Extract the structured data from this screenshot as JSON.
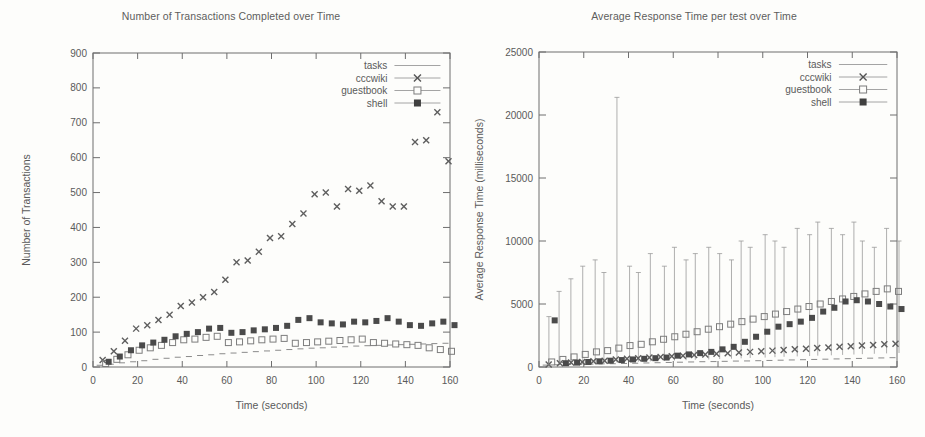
{
  "page": {
    "background": "#fdfdfb",
    "ink": "#5a5a5a"
  },
  "charts": [
    {
      "id": "transactions",
      "title": "Number of Transactions Completed over Time",
      "xlabel": "Time (seconds)",
      "ylabel": "Number of Transactions"
    },
    {
      "id": "response-time",
      "title": "Average Response Time per test over Time",
      "xlabel": "Time (seconds)",
      "ylabel": "Average Response Time (milliseconds)"
    }
  ],
  "chart_data": [
    {
      "type": "scatter",
      "id": "transactions",
      "title": "Number of Transactions Completed over Time",
      "xlabel": "Time (seconds)",
      "ylabel": "Number of Transactions",
      "xlim": [
        0,
        160
      ],
      "ylim": [
        0,
        900
      ],
      "xticks": [
        0,
        20,
        40,
        60,
        80,
        100,
        120,
        140,
        160
      ],
      "yticks": [
        0,
        100,
        200,
        300,
        400,
        500,
        600,
        700,
        800,
        900
      ],
      "grid": false,
      "legend_position": "top-right",
      "legend": [
        "tasks",
        "cccwiki",
        "guestbook",
        "shell"
      ],
      "x": [
        5,
        10,
        15,
        20,
        25,
        30,
        35,
        40,
        45,
        50,
        55,
        60,
        65,
        70,
        75,
        80,
        85,
        90,
        95,
        100,
        105,
        110,
        115,
        120,
        125,
        130,
        135,
        140,
        145,
        150,
        155,
        160
      ],
      "series": [
        {
          "name": "tasks",
          "marker": "line",
          "values": [
            5,
            8,
            12,
            15,
            18,
            22,
            25,
            28,
            30,
            33,
            35,
            38,
            40,
            42,
            44,
            46,
            48,
            50,
            52,
            54,
            55,
            57,
            58,
            60,
            61,
            62,
            63,
            64,
            65,
            66,
            67,
            68
          ]
        },
        {
          "name": "cccwiki",
          "marker": "cross",
          "values": [
            20,
            45,
            75,
            110,
            120,
            135,
            150,
            175,
            185,
            200,
            215,
            250,
            300,
            305,
            330,
            370,
            375,
            410,
            440,
            495,
            500,
            460,
            510,
            505,
            520,
            475,
            460,
            460,
            645,
            650,
            730,
            590
          ]
        },
        {
          "name": "guestbook",
          "marker": "open-square",
          "values": [
            10,
            22,
            35,
            48,
            55,
            62,
            70,
            78,
            80,
            85,
            88,
            70,
            72,
            75,
            78,
            80,
            82,
            68,
            70,
            72,
            74,
            76,
            78,
            80,
            70,
            68,
            66,
            64,
            62,
            55,
            50,
            45
          ]
        },
        {
          "name": "shell",
          "marker": "filled-square",
          "values": [
            15,
            30,
            48,
            62,
            70,
            78,
            88,
            95,
            100,
            110,
            112,
            98,
            100,
            105,
            108,
            112,
            118,
            135,
            140,
            128,
            125,
            122,
            130,
            128,
            132,
            140,
            130,
            120,
            118,
            125,
            130,
            120
          ]
        }
      ]
    },
    {
      "type": "scatter",
      "id": "response-time",
      "title": "Average Response Time per test over Time",
      "xlabel": "Time (seconds)",
      "ylabel": "Average Response Time (milliseconds)",
      "xlim": [
        0,
        160
      ],
      "ylim": [
        0,
        25000
      ],
      "xticks": [
        0,
        20,
        40,
        60,
        80,
        100,
        120,
        140,
        160
      ],
      "yticks": [
        0,
        5000,
        10000,
        15000,
        20000,
        25000
      ],
      "grid": false,
      "legend_position": "top-right",
      "legend": [
        "tasks",
        "cccwiki",
        "guestbook",
        "shell"
      ],
      "x": [
        5,
        10,
        15,
        20,
        25,
        30,
        35,
        40,
        45,
        50,
        55,
        60,
        65,
        70,
        75,
        80,
        85,
        90,
        95,
        100,
        105,
        110,
        115,
        120,
        125,
        130,
        135,
        140,
        145,
        150,
        155,
        160
      ],
      "series": [
        {
          "name": "tasks",
          "marker": "line",
          "values": [
            150,
            180,
            200,
            210,
            230,
            250,
            260,
            280,
            300,
            320,
            340,
            360,
            380,
            400,
            420,
            430,
            450,
            470,
            480,
            500,
            520,
            540,
            560,
            580,
            600,
            620,
            640,
            660,
            680,
            700,
            720,
            740
          ]
        },
        {
          "name": "cccwiki",
          "marker": "cross",
          "values": [
            200,
            300,
            350,
            400,
            450,
            500,
            600,
            650,
            700,
            750,
            800,
            850,
            900,
            950,
            1000,
            1050,
            1100,
            1150,
            1200,
            1250,
            1300,
            1350,
            1400,
            1450,
            1500,
            1550,
            1600,
            1650,
            1700,
            1750,
            1800,
            1850
          ],
          "errorbars_high": [
            4000,
            6000,
            7000,
            8000,
            8500,
            7500,
            21400,
            8000,
            7500,
            9000,
            8000,
            9500,
            8500,
            9000,
            9500,
            9000,
            8500,
            10000,
            9500,
            10500,
            10000,
            9500,
            11000,
            10500,
            11500,
            11000,
            10500,
            11500,
            10000,
            9500,
            11000,
            10000
          ]
        },
        {
          "name": "guestbook",
          "marker": "open-square",
          "values": [
            400,
            600,
            800,
            1000,
            1200,
            1300,
            1500,
            1700,
            1800,
            2000,
            2200,
            2400,
            2600,
            2800,
            3000,
            3200,
            3400,
            3600,
            3800,
            4000,
            4200,
            4400,
            4600,
            4800,
            5000,
            5200,
            5400,
            5600,
            5800,
            6000,
            6200,
            6000
          ]
        },
        {
          "name": "shell",
          "marker": "filled-square",
          "values": [
            3700,
            300,
            350,
            400,
            450,
            500,
            550,
            600,
            650,
            700,
            750,
            900,
            1000,
            1100,
            1200,
            1400,
            1600,
            2000,
            2400,
            2800,
            3200,
            3400,
            3600,
            3900,
            4400,
            4700,
            5200,
            5300,
            5200,
            5000,
            4800,
            4600
          ]
        }
      ]
    }
  ]
}
